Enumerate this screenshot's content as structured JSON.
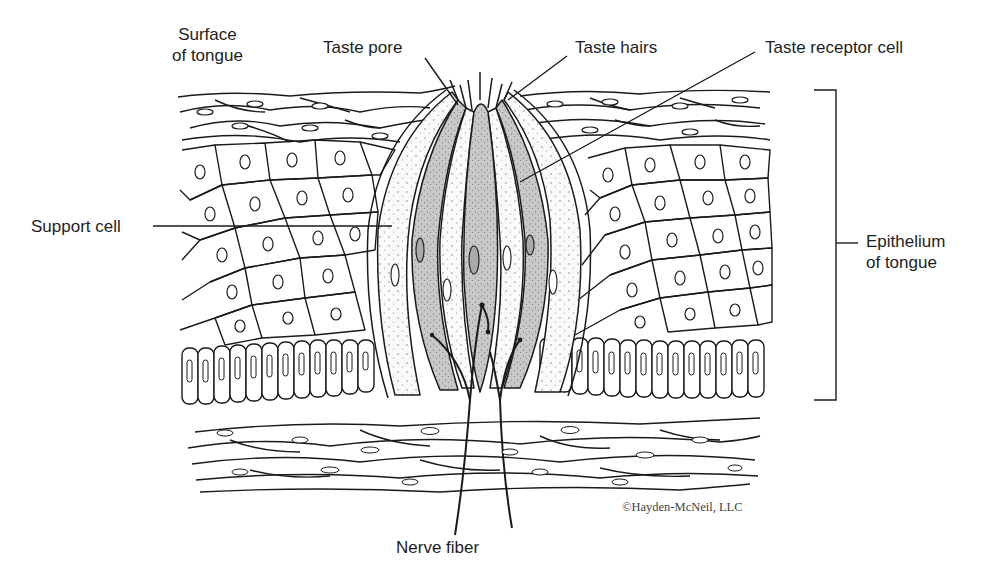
{
  "diagram": {
    "labels": {
      "surface_line1": "Surface",
      "surface_line2": "of tongue",
      "taste_pore": "Taste pore",
      "taste_hairs": "Taste hairs",
      "taste_receptor_cell": "Taste receptor cell",
      "support_cell": "Support cell",
      "epithelium_line1": "Epithelium",
      "epithelium_line2": "of tongue",
      "nerve_fiber": "Nerve fiber"
    },
    "copyright": "©Hayden-McNeil, LLC",
    "colors": {
      "line": "#1a1a1a",
      "receptor_fill": "#c9c9c9",
      "support_fill": "#f4f4f4",
      "background": "#ffffff"
    }
  }
}
